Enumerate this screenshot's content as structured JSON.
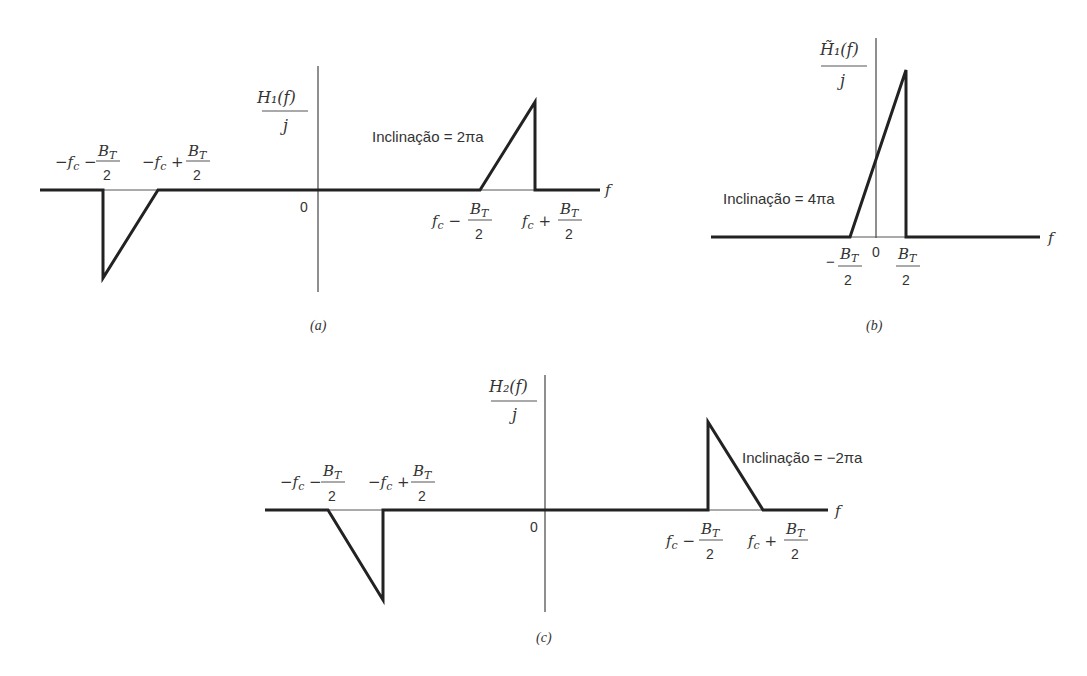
{
  "panels": {
    "a": {
      "caption": "(a)",
      "ylabel_num": "H₁(f)",
      "ylabel_den": "j",
      "origin": "0",
      "xlabel": "f",
      "slope_label": "Inclinação = 2πa",
      "ticks": [
        {
          "pre": "−f_c −",
          "num": "B_T",
          "den": "2"
        },
        {
          "pre": "−f_c +",
          "num": "B_T",
          "den": "2"
        },
        {
          "pre": "f_c −",
          "num": "B_T",
          "den": "2"
        },
        {
          "pre": "f_c +",
          "num": "B_T",
          "den": "2"
        }
      ]
    },
    "b": {
      "caption": "(b)",
      "ylabel_num": "H̃₁(f)",
      "ylabel_den": "j",
      "origin": "0",
      "xlabel": "f",
      "slope_label": "Inclinação = 4πa",
      "ticks": [
        {
          "pre": "−",
          "num": "B_T",
          "den": "2"
        },
        {
          "pre": "",
          "num": "B_T",
          "den": "2"
        }
      ]
    },
    "c": {
      "caption": "(c)",
      "ylabel_num": "H₂(f)",
      "ylabel_den": "j",
      "origin": "0",
      "xlabel": "f",
      "slope_label": "Inclinação = −2πa",
      "ticks": [
        {
          "pre": "−f_c −",
          "num": "B_T",
          "den": "2"
        },
        {
          "pre": "−f_c +",
          "num": "B_T",
          "den": "2"
        },
        {
          "pre": "f_c −",
          "num": "B_T",
          "den": "2"
        },
        {
          "pre": "f_c +",
          "num": "B_T",
          "den": "2"
        }
      ]
    }
  }
}
